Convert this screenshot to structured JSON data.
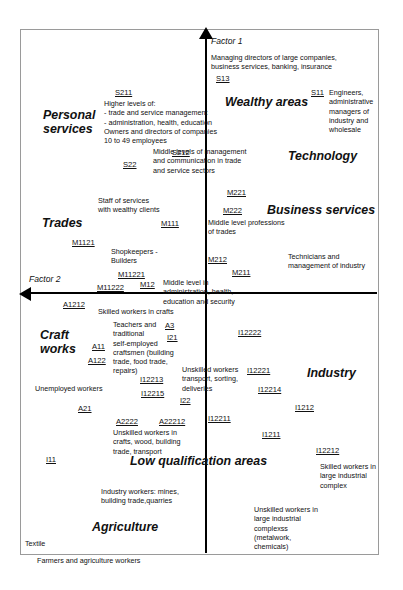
{
  "diagram": {
    "axes": {
      "vertical": {
        "label": "Factor 1",
        "name": "factor-1-axis"
      },
      "horizontal": {
        "label": "Factor 2",
        "name": "factor-2-axis"
      }
    },
    "zones": [
      {
        "id": "wealthy-areas",
        "label": "Wealthy areas",
        "x": 225,
        "y": 95
      },
      {
        "id": "personal-services",
        "label": "Personal\nservices",
        "x": 43,
        "y": 108
      },
      {
        "id": "technology",
        "label": "Technology",
        "x": 288,
        "y": 149
      },
      {
        "id": "business-services",
        "label": "Business services",
        "x": 267,
        "y": 203
      },
      {
        "id": "trades",
        "label": "Trades",
        "x": 42,
        "y": 216
      },
      {
        "id": "craft-works",
        "label": "Craft\nworks",
        "x": 40,
        "y": 328
      },
      {
        "id": "industry",
        "label": "Industry",
        "x": 307,
        "y": 366
      },
      {
        "id": "low-qualification",
        "label": "Low qualification areas",
        "x": 130,
        "y": 454
      },
      {
        "id": "agriculture",
        "label": "Agriculture",
        "x": 92,
        "y": 520
      }
    ],
    "descriptions": [
      {
        "id": "managing-directors",
        "text": "Managing directors of large companies,\nbusiness services, banking, insurance",
        "x": 211,
        "y": 53,
        "w": 190
      },
      {
        "id": "higher-levels",
        "text": "Higher levels of:\n- trade and service management\n- administration, health, education\nOwners and directors of companies\n10 to 49 employees",
        "x": 104,
        "y": 99,
        "w": 150
      },
      {
        "id": "engineers",
        "text": "Engineers,\nadministrative\nmanagers of\nindustry and\nwholesale",
        "x": 329,
        "y": 88,
        "w": 68
      },
      {
        "id": "middle-levels-mgmt",
        "text": "Middle levels of management\nand communication in trade\nand service sectors",
        "x": 153,
        "y": 147,
        "w": 140
      },
      {
        "id": "staff-wealthy-clients",
        "text": "Staff of services\nwith wealthy clients",
        "x": 98,
        "y": 196,
        "w": 100
      },
      {
        "id": "middle-level-trades",
        "text": "Middle level  professions\nof trades",
        "x": 208,
        "y": 218,
        "w": 120
      },
      {
        "id": "shopkeepers-builders",
        "text": "Shopkeepers -\nBuilders",
        "x": 111,
        "y": 247,
        "w": 80
      },
      {
        "id": "technicians-industry",
        "text": "Technicians and\nmanagement of industry",
        "x": 288,
        "y": 252,
        "w": 110
      },
      {
        "id": "middle-level-admin",
        "text": "Middle level in\nadministration, health,\neducation and security",
        "x": 163,
        "y": 278,
        "w": 110
      },
      {
        "id": "skilled-workers-crafts",
        "text": "Skilled workers in crafts",
        "x": 98,
        "y": 307,
        "w": 110
      },
      {
        "id": "teachers-craftsmen",
        "text": "Teachers and\ntraditional\nself-employed\ncraftsmen (building\ntrade, food trade,\nrepairs)",
        "x": 113,
        "y": 320,
        "w": 80
      },
      {
        "id": "unemployed-workers",
        "text": "Unemployed workers",
        "x": 35,
        "y": 384,
        "w": 100
      },
      {
        "id": "unskilled-transport",
        "text": "Unskilled workers\ntransport, sorting,\ndeliveries",
        "x": 182,
        "y": 365,
        "w": 80
      },
      {
        "id": "unskilled-crafts-wood",
        "text": "Unskilled workers in\ncrafts, wood, building\ntrade, transport",
        "x": 113,
        "y": 428,
        "w": 100
      },
      {
        "id": "skilled-large-industry",
        "text": "Skilled workers in\nlarge industrial\ncomplex",
        "x": 320,
        "y": 462,
        "w": 80
      },
      {
        "id": "industry-workers-mines",
        "text": "Industry workers: mines,\nbuilding trade,quarries",
        "x": 101,
        "y": 487,
        "w": 110
      },
      {
        "id": "unskilled-large-cplx",
        "text": "Unskilled workers in\nlarge industrial\ncomplexss\n(metalwork,\nchemicals)",
        "x": 254,
        "y": 505,
        "w": 95
      },
      {
        "id": "textile",
        "text": "Textile",
        "x": 25,
        "y": 539,
        "w": 50
      },
      {
        "id": "farmers",
        "text": "Farmers and agriculture workers",
        "x": 37,
        "y": 556,
        "w": 150
      }
    ],
    "codes": [
      {
        "id": "S13",
        "label": "S13",
        "x": 216,
        "y": 74
      },
      {
        "id": "S211",
        "label": "S211",
        "x": 115,
        "y": 88
      },
      {
        "id": "S11",
        "label": "S11",
        "x": 311,
        "y": 88
      },
      {
        "id": "S212",
        "label": "S212",
        "x": 172,
        "y": 148
      },
      {
        "id": "S22",
        "label": "S22",
        "x": 123,
        "y": 160
      },
      {
        "id": "M221",
        "label": "M221",
        "x": 227,
        "y": 188
      },
      {
        "id": "M222",
        "label": "M222",
        "x": 223,
        "y": 206
      },
      {
        "id": "M111",
        "label": "M111",
        "x": 161,
        "y": 219
      },
      {
        "id": "M1121",
        "label": "M1121",
        "x": 72,
        "y": 238
      },
      {
        "id": "M11221",
        "label": "M11221",
        "x": 118,
        "y": 270
      },
      {
        "id": "M212",
        "label": "M212",
        "x": 208,
        "y": 255
      },
      {
        "id": "M211",
        "label": "M211",
        "x": 232,
        "y": 268
      },
      {
        "id": "M11222",
        "label": "M11222",
        "x": 97,
        "y": 283
      },
      {
        "id": "M12",
        "label": "M12",
        "x": 140,
        "y": 280
      },
      {
        "id": "A1212",
        "label": "A1212",
        "x": 63,
        "y": 300
      },
      {
        "id": "A3",
        "label": "A3",
        "x": 165,
        "y": 321
      },
      {
        "id": "I21",
        "label": "I21",
        "x": 167,
        "y": 333
      },
      {
        "id": "A11",
        "label": "A11",
        "x": 92,
        "y": 342
      },
      {
        "id": "I12222",
        "label": "I12222",
        "x": 238,
        "y": 328
      },
      {
        "id": "A122",
        "label": "A122",
        "x": 88,
        "y": 356
      },
      {
        "id": "I12221",
        "label": "I12221",
        "x": 247,
        "y": 366
      },
      {
        "id": "I12213",
        "label": "I12213",
        "x": 140,
        "y": 375
      },
      {
        "id": "I12215",
        "label": "I12215",
        "x": 141,
        "y": 389
      },
      {
        "id": "I12214",
        "label": "I12214",
        "x": 258,
        "y": 385
      },
      {
        "id": "I22",
        "label": "I22",
        "x": 180,
        "y": 396
      },
      {
        "id": "A21",
        "label": "A21",
        "x": 78,
        "y": 404
      },
      {
        "id": "I1212",
        "label": "I1212",
        "x": 295,
        "y": 403
      },
      {
        "id": "A2222",
        "label": "A2222",
        "x": 116,
        "y": 417
      },
      {
        "id": "A22212",
        "label": "A22212",
        "x": 159,
        "y": 417
      },
      {
        "id": "I12211",
        "label": "I12211",
        "x": 208,
        "y": 414
      },
      {
        "id": "I1211",
        "label": "I1211",
        "x": 262,
        "y": 430
      },
      {
        "id": "I12212",
        "label": "I12212",
        "x": 316,
        "y": 446
      },
      {
        "id": "I11",
        "label": "I11",
        "x": 46,
        "y": 455
      }
    ]
  }
}
